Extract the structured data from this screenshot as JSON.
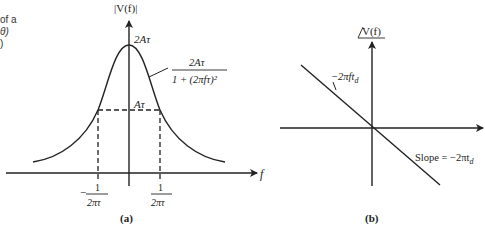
{
  "caption_fragment": {
    "line1": "of a",
    "line2": "θ)",
    "line3": ")"
  },
  "panel_a": {
    "y_axis_label": "|V(f)|",
    "peak_label": "2Aτ",
    "half_label": "Aτ",
    "curve_label_numerator": "2Aτ",
    "curve_label_denominator": "1 + (2πfτ)²",
    "x_axis_label": "f",
    "left_tick_sign": "−",
    "left_tick_num": "1",
    "left_tick_den": "2πτ",
    "right_tick_num": "1",
    "right_tick_den": "2πτ",
    "panel_label": "(a)"
  },
  "panel_b": {
    "y_axis_label": "V(f)",
    "line_label": "−2πft",
    "line_label_sub": "d",
    "slope_label": "Slope = −2πt",
    "slope_label_sub": "d",
    "panel_label": "(b)"
  },
  "colors": {
    "stroke": "#222222",
    "background": "#ffffff"
  }
}
